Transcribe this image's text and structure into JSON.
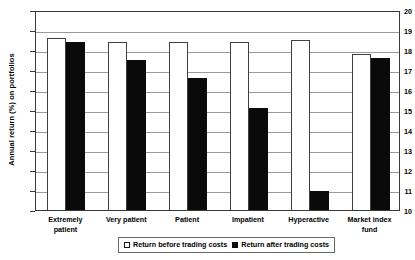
{
  "chart_data": {
    "type": "bar",
    "title": "",
    "xlabel": "",
    "ylabel": "Annual return (%) on portfolios",
    "ylim": [
      10,
      20
    ],
    "ytick_step": 1,
    "yticks": [
      "20",
      "19",
      "18",
      "17",
      "16",
      "15",
      "14",
      "13",
      "12",
      "11",
      "10"
    ],
    "grid": true,
    "legend_position": "bottom-center",
    "categories": [
      "Extremely\npatient",
      "Very patient",
      "Patient",
      "Impatient",
      "Hyperactive",
      "Market index\nfund"
    ],
    "series": [
      {
        "name": "Return before trading costs",
        "style": "hollow",
        "color": "#ffffff",
        "edge_color": "#404040",
        "values": [
          18.7,
          18.5,
          18.5,
          18.5,
          18.6,
          17.9
        ]
      },
      {
        "name": "Return after trading costs",
        "style": "solid",
        "color": "#0a0a0a",
        "edge_color": "#0a0a0a",
        "values": [
          18.5,
          17.6,
          16.7,
          15.2,
          11.05,
          17.7
        ]
      }
    ]
  },
  "axis": {
    "frame_color": "#3a3a3a",
    "grid_color": "#9a9a9a"
  }
}
